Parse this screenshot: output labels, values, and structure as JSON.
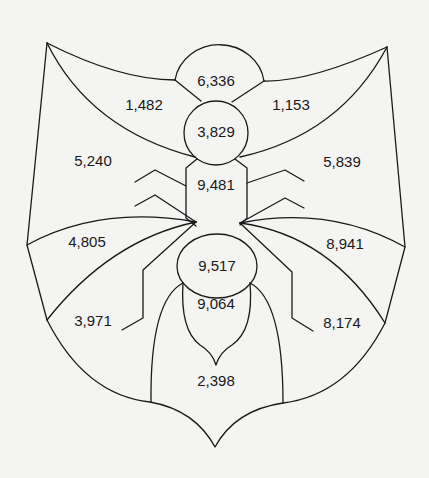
{
  "diagram": {
    "type": "bug-shaped region map with numeric labels",
    "regions": {
      "head": "6,336",
      "neck": "3,829",
      "thorax": "9,481",
      "abdomen_top": "9,517",
      "abdomen_mid": "9,064",
      "tail": "2,398",
      "left_upper_wing": "1,482",
      "right_upper_wing": "1,153",
      "left_outer": "5,240",
      "right_outer": "5,839",
      "left_lower_wing": "4,805",
      "right_lower_wing": "8,941",
      "left_bottom": "3,971",
      "right_bottom": "8,174"
    }
  }
}
